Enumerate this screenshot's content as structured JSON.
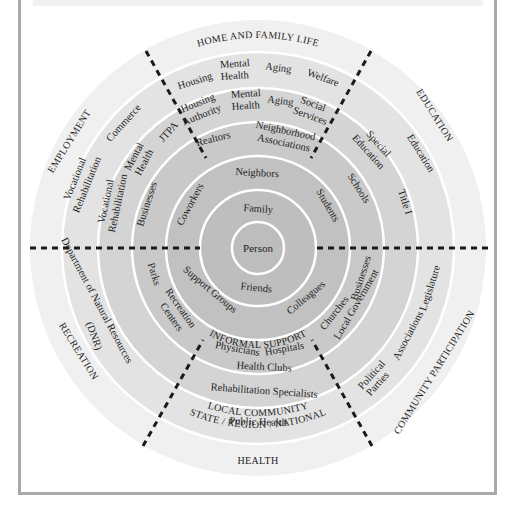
{
  "diagram": {
    "type": "concentric-ecological-map",
    "center": {
      "x": 258,
      "y": 248
    },
    "colors": {
      "frame": "#a9a9a9",
      "ring_outer": "#f0f0f0",
      "ring_2": "#e3e3e3",
      "ring_3": "#d4d4d4",
      "ring_4": "#c9c9c9",
      "ring_5": "#c1c1c1",
      "ring_6": "#bcbcbc",
      "ring_core": "#bdbdbd",
      "divider": "#ffffff",
      "dash": "#1a1a1a"
    },
    "core": {
      "label": "Person"
    },
    "level_labels": {
      "informal_support": "INFORMAL SUPPORT",
      "local_community": "LOCAL COMMUNITY",
      "state_region_national": "STATE / REGION / NATIONAL"
    },
    "domains": {
      "home": "HOME AND FAMILY LIFE",
      "education": "EDUCATION",
      "community": "COMMUNITY PARTICIPATION",
      "health": "HEALTH",
      "recreation": "RECREATION",
      "employment": "EMPLOYMENT"
    },
    "ring1": {
      "family": "Family",
      "friends": "Friends"
    },
    "ring2": {
      "neighbors": "Neighbors",
      "students": "Students",
      "colleagues": "Colleagues",
      "support_groups": "Support Groups",
      "coworkers": "Coworkers"
    },
    "ring3": {
      "realtors": "Realtors",
      "neighborhood": "Neighborhood",
      "associations": "Associations",
      "schools": "Schools",
      "businesses_right": "Businesses",
      "churches": "Churches",
      "local_government": "Local Government",
      "physicians": "Physicians",
      "hospitals": "Hospitals",
      "health_clubs": "Health Clubs",
      "parks": "Parks",
      "recreation": "Recreation",
      "centers": "Centers",
      "businesses_left": "Businesses"
    },
    "ring4": {
      "housing": "Housing",
      "authority": "Authority",
      "mental": "Mental",
      "health": "Health",
      "aging": "Aging",
      "social": "Social",
      "services": "Services",
      "special": "Special",
      "education": "Education",
      "rehab_specialists": "Rehabilitation Specialists",
      "jtpa": "JTPA",
      "vocational": "Vocational",
      "rehabilitation": "Rehabilitation",
      "dnr_1": "Department of Natural Resources",
      "dnr_2": "(DNR)"
    },
    "ring5": {
      "housing": "Housing",
      "mental": "Mental",
      "health": "Health",
      "aging": "Aging",
      "welfare": "Welfare",
      "education": "Education",
      "title_i": "Title I",
      "legislature": "Legislature",
      "associations": "Associations",
      "political": "Political",
      "parties": "Parties",
      "public_health": "Public Health",
      "commerce": "Commerce",
      "vocational": "Vocational",
      "rehabilitation": "Rehabilitation"
    }
  }
}
